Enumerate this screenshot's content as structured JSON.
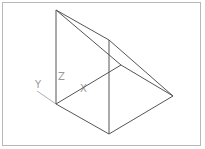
{
  "viewport": {
    "title": "3D wireframe wedge viewport"
  },
  "axes": {
    "x_label": "X",
    "y_label": "Y",
    "z_label": "Z",
    "color": "#a8a8a8"
  },
  "model": {
    "edge_color": "#555555",
    "vertices": {
      "A": [
        56,
        104
      ],
      "B": [
        56,
        10
      ],
      "C": [
        109,
        40
      ],
      "D": [
        109,
        134
      ],
      "E": [
        173,
        96
      ],
      "F": [
        121,
        65
      ]
    },
    "edges": [
      [
        "A",
        "B"
      ],
      [
        "B",
        "C"
      ],
      [
        "B",
        "F"
      ],
      [
        "F",
        "E"
      ],
      [
        "C",
        "E"
      ],
      [
        "C",
        "D"
      ],
      [
        "A",
        "D"
      ],
      [
        "D",
        "E"
      ],
      [
        "A",
        "F"
      ]
    ]
  }
}
